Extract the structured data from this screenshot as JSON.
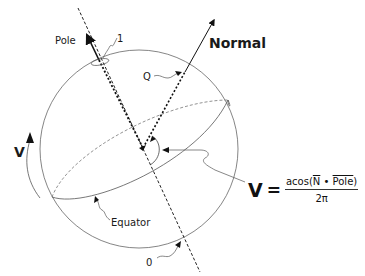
{
  "diagram": {
    "type": "sphere-texture-mapping",
    "labels": {
      "pole": "Pole",
      "pole_marker": "1",
      "normal": "Normal",
      "q": "Q",
      "v_axis": "V",
      "equator": "Equator",
      "zero_marker": "0"
    },
    "formula": {
      "lhs": "V",
      "equals": "=",
      "numerator_prefix": "acos(",
      "numerator_n": "N",
      "numerator_dot": " • ",
      "numerator_pole": "Pole",
      "numerator_suffix": ")",
      "denominator": "2π"
    },
    "colors": {
      "stroke": "#1a1a1a",
      "thin_stroke": "#555555",
      "background": "#ffffff"
    }
  }
}
